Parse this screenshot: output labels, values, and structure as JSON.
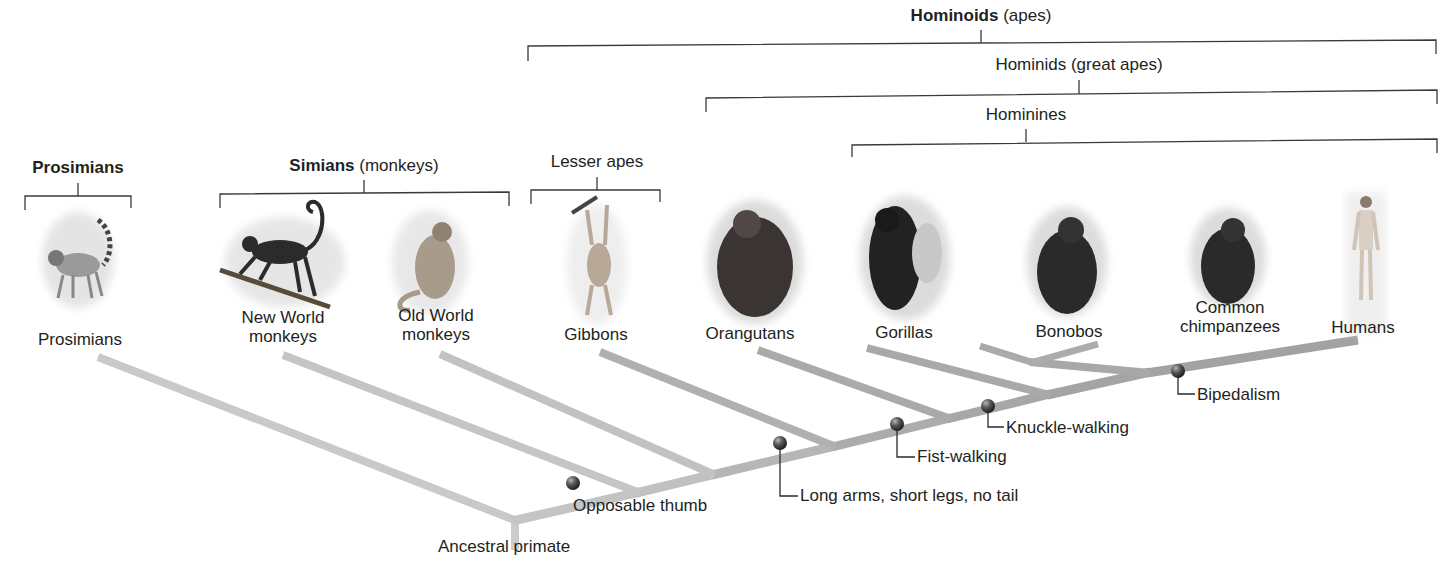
{
  "groups": {
    "hominoids": {
      "bold": "Hominoids",
      "rest": " (apes)"
    },
    "hominids": {
      "text": "Hominids (great apes)"
    },
    "hominines": {
      "text": "Hominines"
    },
    "prosimians": {
      "bold": "Prosimians",
      "rest": ""
    },
    "simians": {
      "bold": "Simians",
      "rest": " (monkeys)"
    },
    "lesser_apes": {
      "text": "Lesser apes"
    }
  },
  "taxa": [
    {
      "id": "prosimians",
      "line1": "Prosimians",
      "line2": ""
    },
    {
      "id": "new-world-monkeys",
      "line1": "New World",
      "line2": "monkeys"
    },
    {
      "id": "old-world-monkeys",
      "line1": "Old World",
      "line2": "monkeys"
    },
    {
      "id": "gibbons",
      "line1": "Gibbons",
      "line2": ""
    },
    {
      "id": "orangutans",
      "line1": "Orangutans",
      "line2": ""
    },
    {
      "id": "gorillas",
      "line1": "Gorillas",
      "line2": ""
    },
    {
      "id": "bonobos",
      "line1": "Bonobos",
      "line2": ""
    },
    {
      "id": "common-chimpanzees",
      "line1": "Common",
      "line2": "chimpanzees"
    },
    {
      "id": "humans",
      "line1": "Humans",
      "line2": ""
    }
  ],
  "traits": [
    {
      "id": "opposable-thumb",
      "label": "Opposable thumb"
    },
    {
      "id": "long-arms",
      "label": "Long arms, short legs, no tail"
    },
    {
      "id": "fist-walking",
      "label": "Fist-walking"
    },
    {
      "id": "knuckle-walking",
      "label": "Knuckle-walking"
    },
    {
      "id": "bipedalism",
      "label": "Bipedalism"
    }
  ],
  "root": {
    "label": "Ancestral primate"
  },
  "colors": {
    "branch_light": "#c9c9c9",
    "branch_mid": "#b3b3b3",
    "branch_dark": "#a2a2a2",
    "node": "#4a4a4a",
    "bracket": "#3a3a3a",
    "text": "#231f20"
  }
}
